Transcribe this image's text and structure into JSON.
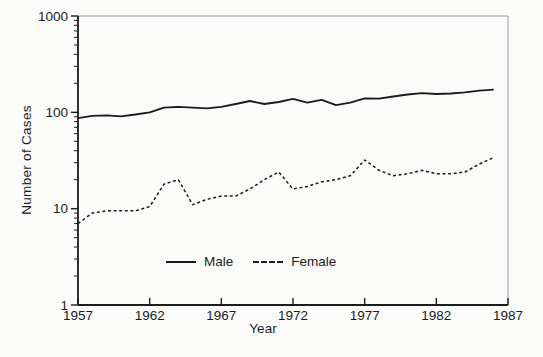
{
  "chart_data": {
    "type": "line",
    "title": "",
    "xlabel": "Year",
    "ylabel": "Number of Cases",
    "x_scale": "linear",
    "y_scale": "log",
    "xlim": [
      1957,
      1987
    ],
    "ylim": [
      1,
      1000
    ],
    "x_ticks": [
      1957,
      1962,
      1967,
      1972,
      1977,
      1982,
      1987
    ],
    "y_ticks": [
      1,
      10,
      100,
      1000
    ],
    "grid": false,
    "legend_position": "inside-bottom-center",
    "x": [
      1957,
      1958,
      1959,
      1960,
      1961,
      1962,
      1963,
      1964,
      1965,
      1966,
      1967,
      1968,
      1969,
      1970,
      1971,
      1972,
      1973,
      1974,
      1975,
      1976,
      1977,
      1978,
      1979,
      1980,
      1981,
      1982,
      1983,
      1984,
      1985,
      1986
    ],
    "series": [
      {
        "name": "Male",
        "line_style": "solid",
        "values": [
          87,
          92,
          93,
          91,
          95,
          100,
          112,
          114,
          112,
          110,
          114,
          122,
          131,
          122,
          128,
          138,
          126,
          135,
          119,
          126,
          140,
          139,
          146,
          153,
          158,
          155,
          157,
          161,
          168,
          172
        ]
      },
      {
        "name": "Female",
        "line_style": "dashed",
        "values": [
          7,
          9,
          9.5,
          9.5,
          9.5,
          10.5,
          18,
          20,
          11,
          12.5,
          13.5,
          13.5,
          16,
          20,
          24,
          16,
          17,
          19,
          20,
          22,
          32,
          25,
          22,
          23,
          25,
          23,
          23,
          24,
          29,
          34
        ]
      }
    ]
  },
  "colors": {
    "line": "#1c1c1c",
    "frame_light": "#9a9a9a",
    "background": "#fbfbfa",
    "text": "#1c1c1c"
  }
}
